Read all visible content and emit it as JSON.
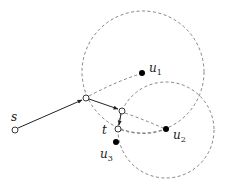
{
  "diagram": {
    "type": "graph-path-with-range-circles",
    "colors": {
      "stroke": "#222222",
      "dashed": "#666666",
      "hollow_fill": "#ffffff",
      "filled": "#000000"
    },
    "circles": [
      {
        "id": "circle-u1",
        "cx": 143,
        "cy": 72,
        "r": 61
      },
      {
        "id": "circle-u2",
        "cx": 166,
        "cy": 130,
        "r": 48
      }
    ],
    "nodes": [
      {
        "id": "s",
        "label": "s",
        "x": 15,
        "y": 130,
        "filled": false
      },
      {
        "id": "a",
        "label": "",
        "x": 86,
        "y": 98,
        "filled": false
      },
      {
        "id": "b",
        "label": "",
        "x": 122,
        "y": 111,
        "filled": false
      },
      {
        "id": "t",
        "label": "t",
        "x": 118,
        "y": 129,
        "filled": false
      },
      {
        "id": "u1",
        "label": "u",
        "sub": "1",
        "x": 142,
        "y": 73,
        "filled": true
      },
      {
        "id": "u2",
        "label": "u",
        "sub": "2",
        "x": 166,
        "y": 129,
        "filled": true
      },
      {
        "id": "u3",
        "label": "u",
        "sub": "3",
        "x": 116,
        "y": 142,
        "filled": true
      }
    ],
    "labels": {
      "s": "s",
      "t": "t",
      "u1": "u",
      "u1_sub": "1",
      "u2": "u",
      "u2_sub": "2",
      "u3": "u",
      "u3_sub": "3"
    },
    "solid_arrows": [
      {
        "from": "s",
        "to": "a"
      },
      {
        "from": "a",
        "to": "b"
      },
      {
        "from": "b",
        "to": "t"
      }
    ],
    "dashed_edges": [
      {
        "from": "a",
        "to": "u1"
      },
      {
        "from": "b",
        "to": "u2"
      },
      {
        "from": "t",
        "to": "u2"
      }
    ]
  }
}
